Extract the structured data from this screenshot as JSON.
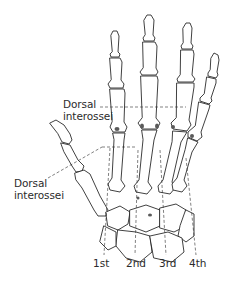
{
  "figure": {
    "labels": {
      "dorsal_interossei_upper": {
        "line1": "Dorsal",
        "line2": "interossei"
      },
      "dorsal_interossei_lower": {
        "line1": "Dorsal",
        "line2": "interossei"
      }
    },
    "interossei_numbers": [
      "1st",
      "2nd",
      "3rd",
      "4th"
    ]
  },
  "colors": {
    "line": "#2b2b2b",
    "shade": "#6a6a6a",
    "background": "#ffffff"
  }
}
